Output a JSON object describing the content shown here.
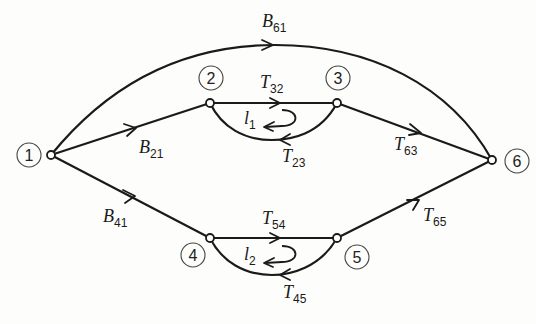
{
  "diagram": {
    "type": "signal-flow-graph",
    "nodes": [
      {
        "id": "1",
        "label": "1",
        "x": 51,
        "y": 155,
        "lx": 22,
        "ly": 155
      },
      {
        "id": "2",
        "label": "2",
        "x": 210,
        "y": 103,
        "lx": 211,
        "ly": 76
      },
      {
        "id": "3",
        "label": "3",
        "x": 337,
        "y": 103,
        "lx": 338,
        "ly": 77
      },
      {
        "id": "4",
        "label": "4",
        "x": 210,
        "y": 238,
        "lx": 193,
        "ly": 256
      },
      {
        "id": "5",
        "label": "5",
        "x": 337,
        "y": 238,
        "lx": 358,
        "ly": 257
      },
      {
        "id": "6",
        "label": "6",
        "x": 492,
        "y": 160,
        "lx": 518,
        "ly": 161
      }
    ],
    "edges": [
      {
        "id": "B61",
        "from": "1",
        "to": "6",
        "var": "B",
        "sub": "61"
      },
      {
        "id": "B21",
        "from": "1",
        "to": "2",
        "var": "B",
        "sub": "21"
      },
      {
        "id": "B41",
        "from": "1",
        "to": "4",
        "var": "B",
        "sub": "41"
      },
      {
        "id": "T32",
        "from": "2",
        "to": "3",
        "var": "T",
        "sub": "32"
      },
      {
        "id": "T23",
        "from": "3",
        "to": "2",
        "var": "T",
        "sub": "23"
      },
      {
        "id": "T63",
        "from": "3",
        "to": "6",
        "var": "T",
        "sub": "63"
      },
      {
        "id": "T54",
        "from": "4",
        "to": "5",
        "var": "T",
        "sub": "54"
      },
      {
        "id": "T45",
        "from": "5",
        "to": "4",
        "var": "T",
        "sub": "45"
      },
      {
        "id": "T65",
        "from": "5",
        "to": "6",
        "var": "T",
        "sub": "65"
      }
    ],
    "loops": [
      {
        "id": "l1",
        "var": "l",
        "sub": "1"
      },
      {
        "id": "l2",
        "var": "l",
        "sub": "2"
      }
    ]
  },
  "labels": {
    "B61": {
      "var": "B",
      "sub": "61"
    },
    "B21": {
      "var": "B",
      "sub": "21"
    },
    "B41": {
      "var": "B",
      "sub": "41"
    },
    "T32": {
      "var": "T",
      "sub": "32"
    },
    "T23": {
      "var": "T",
      "sub": "23"
    },
    "T63": {
      "var": "T",
      "sub": "63"
    },
    "T54": {
      "var": "T",
      "sub": "54"
    },
    "T45": {
      "var": "T",
      "sub": "45"
    },
    "T65": {
      "var": "T",
      "sub": "65"
    },
    "l1": {
      "var": "l",
      "sub": "1"
    },
    "l2": {
      "var": "l",
      "sub": "2"
    },
    "n1": "1",
    "n2": "2",
    "n3": "3",
    "n4": "4",
    "n5": "5",
    "n6": "6"
  }
}
